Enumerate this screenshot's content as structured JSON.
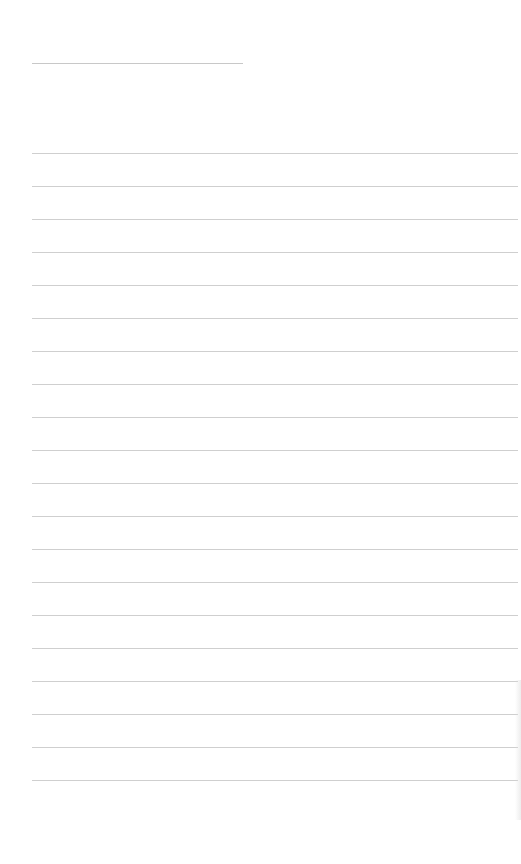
{
  "page": {
    "type": "lined-paper",
    "background_color": "#ffffff",
    "line_color": "#cfcfcf",
    "title_line": {
      "x": 32,
      "y": 63,
      "width": 211
    },
    "ruled_lines": {
      "count": 20,
      "start_y": 153,
      "spacing": 33,
      "x": 32,
      "width": 486
    },
    "text_content": []
  }
}
